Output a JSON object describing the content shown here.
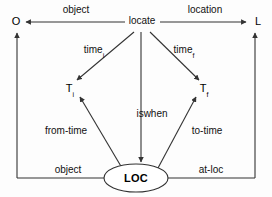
{
  "diagram": {
    "type": "semantic-network",
    "nodes": {
      "object_endpoint": "O",
      "location_endpoint": "L",
      "relation": "locate",
      "time_initial": "T",
      "time_initial_subscript": "i",
      "time_final": "T",
      "time_final_subscript": "f",
      "loc_state": "LOC"
    },
    "edge_labels": {
      "object_top": "object",
      "location_top": "location",
      "time_initial": "time",
      "time_initial_subscript": "i",
      "time_final": "time",
      "time_final_subscript": "f",
      "iswhen": "iswhen",
      "from_time": "from-time",
      "to_time": "to-time",
      "object_bottom": "object",
      "at_loc": "at-loc"
    },
    "colors": {
      "stroke": "#333333",
      "text": "#111111",
      "background": "#fdfdfd"
    }
  }
}
